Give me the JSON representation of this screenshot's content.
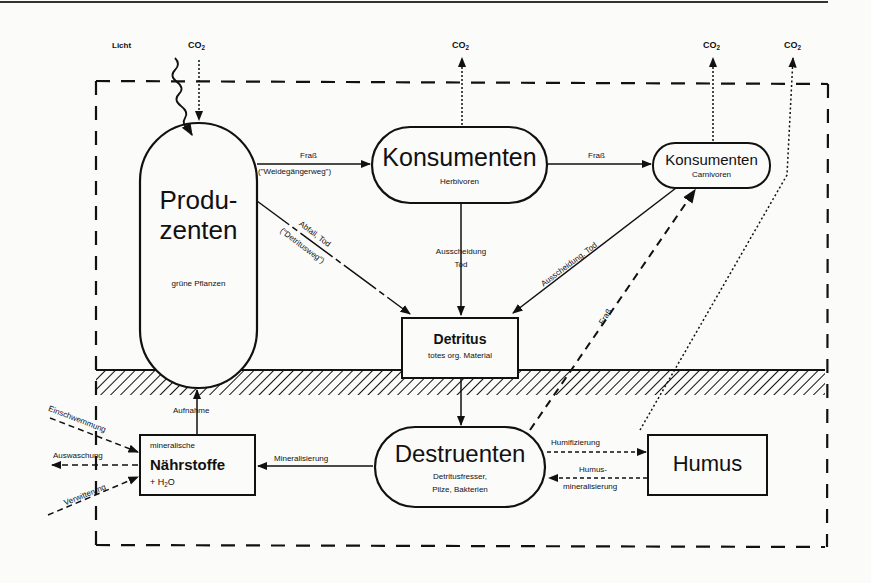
{
  "top_rule": {
    "color": "#222222"
  },
  "external": {
    "light": "Licht",
    "co2_in": "CO",
    "co2_out_1": "CO",
    "co2_out_2": "CO",
    "co2_out_3": "CO",
    "co2_subscript": "2"
  },
  "nodes": {
    "produzenten": {
      "title_line1": "Produ-",
      "title_line2": "zenten",
      "subtitle": "grüne Pflanzen"
    },
    "konsumenten_herbivoren": {
      "title": "Konsumenten",
      "subtitle": "Herbivoren"
    },
    "konsumenten_carnivoren": {
      "title": "Konsumenten",
      "subtitle": "Carnivoren"
    },
    "detritus": {
      "title": "Detritus",
      "subtitle": "totes org. Material"
    },
    "destruenten": {
      "title": "Destruenten",
      "subtitle_line1": "Detritusfresser,",
      "subtitle_line2": "Pilze, Bakterien"
    },
    "naehrstoffe": {
      "line1": "mineralische",
      "title": "Nährstoffe",
      "line3_prefix": "+ H",
      "line3_sub": "2",
      "line3_suffix": "O"
    },
    "humus": {
      "title": "Humus"
    }
  },
  "edges": {
    "prod_to_herb": {
      "label": "Fraß",
      "sublabel": "(\"Weidegängerweg\")"
    },
    "herb_to_carn": {
      "label": "Fraß"
    },
    "prod_to_detritus": {
      "label": "Abfall, Tod",
      "sublabel": "(\"Detritusweg\")"
    },
    "herb_to_detritus": {
      "label_line1": "Ausscheidung",
      "label_line2": "Tod"
    },
    "carn_to_detritus": {
      "label": "Ausscheidung, Tod"
    },
    "destr_to_carn": {
      "label": "Fraß"
    },
    "naehr_to_prod": {
      "label": "Aufnahme"
    },
    "destr_to_naehr": {
      "label": "Mineralisierung"
    },
    "destr_to_humus": {
      "label": "Humifizierung"
    },
    "humus_to_destr": {
      "label_line1": "Humus-",
      "label_line2": "mineralisierung"
    },
    "in_einschwemmung": {
      "label": "Einschwemmung"
    },
    "out_auswaschung": {
      "label": "Auswaschung"
    },
    "in_verwitterung": {
      "label": "Verwitterung"
    }
  }
}
